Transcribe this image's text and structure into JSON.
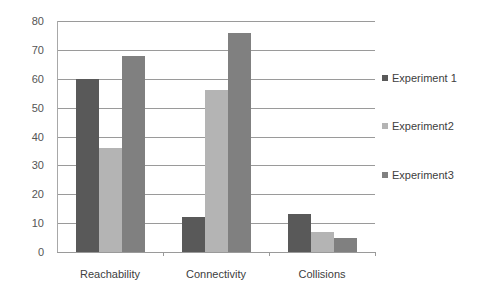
{
  "chart_data": {
    "type": "bar",
    "title": "",
    "xlabel": "",
    "ylabel": "",
    "categories": [
      "Reachability",
      "Connectivity",
      "Collisions"
    ],
    "series": [
      {
        "name": "Experiment 1",
        "values": [
          60,
          12,
          13
        ],
        "color": "#595959"
      },
      {
        "name": "Experiment2",
        "values": [
          36,
          56,
          7
        ],
        "color": "#b4b4b4"
      },
      {
        "name": "Experiment3",
        "values": [
          68,
          76,
          5
        ],
        "color": "#808080"
      }
    ],
    "ylim": [
      0,
      80
    ],
    "yticks": [
      "0",
      "10",
      "20",
      "30",
      "40",
      "50",
      "60",
      "70",
      "80"
    ],
    "grid": true,
    "legend_position": "right"
  }
}
